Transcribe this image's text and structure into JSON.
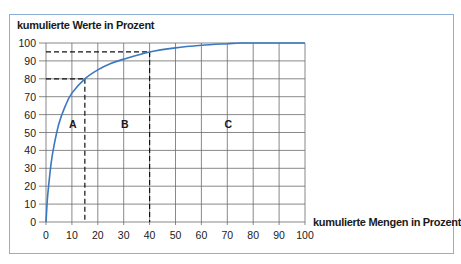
{
  "chart_data": {
    "type": "line",
    "title": "",
    "ylabel": "kumulierte Werte in Prozent",
    "xlabel": "kumulierte Mengen in Prozent",
    "xlim": [
      0,
      100
    ],
    "ylim": [
      0,
      100
    ],
    "x_ticks": [
      0,
      10,
      20,
      30,
      40,
      50,
      60,
      70,
      80,
      90,
      100
    ],
    "y_ticks": [
      0,
      10,
      20,
      30,
      40,
      50,
      60,
      70,
      80,
      90,
      100
    ],
    "grid": true,
    "series": [
      {
        "name": "ABC-Kurve",
        "color": "#3a78c0",
        "x": [
          0,
          0.5,
          1,
          2,
          3,
          5,
          7.5,
          10,
          15,
          20,
          25,
          30,
          40,
          50,
          60,
          70,
          75,
          80,
          90,
          100
        ],
        "y": [
          0,
          12,
          20,
          33,
          42,
          55,
          65,
          72,
          80,
          85,
          88.5,
          91,
          95,
          97.3,
          98.7,
          99.6,
          100,
          100,
          100,
          100
        ]
      }
    ],
    "reference_lines": [
      {
        "x": 15,
        "y": 80,
        "style": "dashed"
      },
      {
        "x": 40,
        "y": 95,
        "style": "dashed"
      }
    ],
    "annotations": [
      {
        "text": "A",
        "x": 10,
        "y": 55
      },
      {
        "text": "B",
        "x": 30,
        "y": 55
      },
      {
        "text": "C",
        "x": 70,
        "y": 55
      }
    ],
    "legend": null
  },
  "labels": {
    "y_axis_title": "kumulierte Werte in Prozent",
    "x_axis_title": "kumulierte Mengen in Prozent",
    "zone_a": "A",
    "zone_b": "B",
    "zone_c": "C"
  }
}
